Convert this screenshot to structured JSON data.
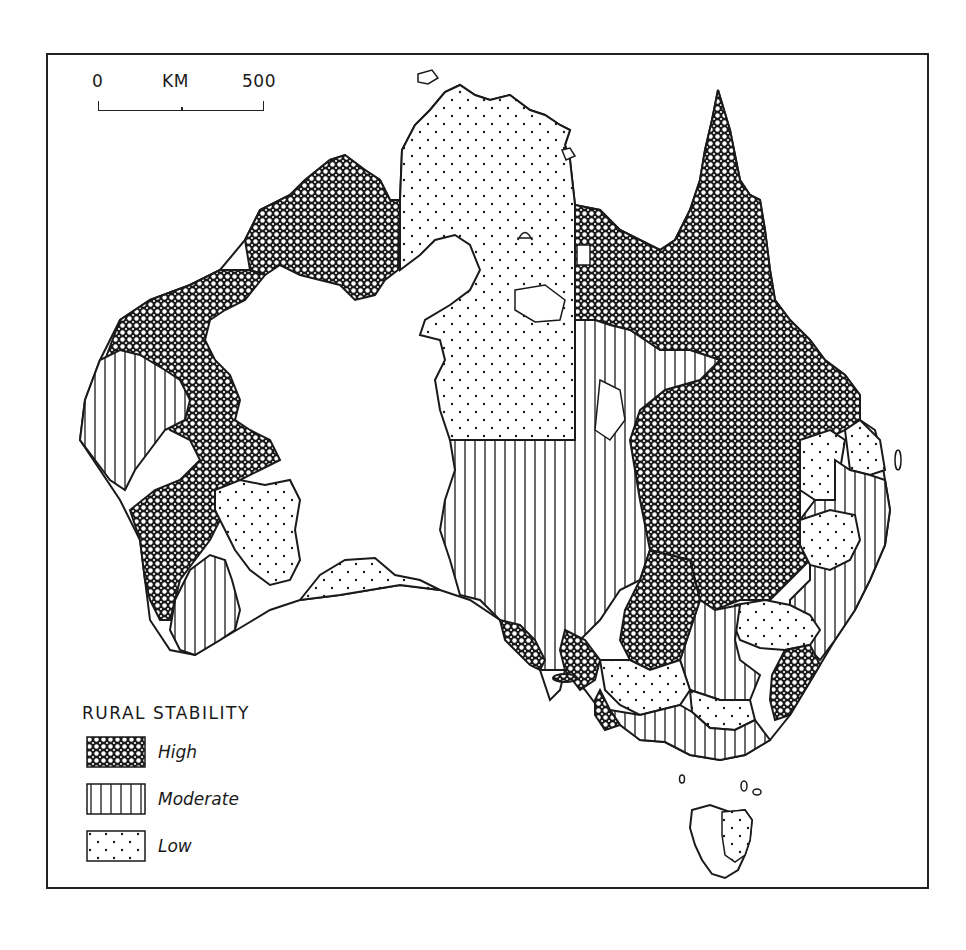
{
  "map": {
    "title": "Rural Stability — Australia",
    "scale_bar": {
      "start_label": "0",
      "unit_label": "KM",
      "end_label": "500"
    },
    "legend": {
      "title": "RURAL  STABILITY",
      "items": [
        {
          "key": "high",
          "label": "High",
          "pattern": "crosshatch"
        },
        {
          "key": "moderate",
          "label": "Moderate",
          "pattern": "vertical-lines"
        },
        {
          "key": "low",
          "label": "Low",
          "pattern": "dots"
        }
      ]
    },
    "colors": {
      "ink": "#1a1a1a",
      "paper": "#ffffff"
    },
    "regions": [
      {
        "name": "Kimberley / Top End west",
        "class": "high"
      },
      {
        "name": "Western Australia coast",
        "class": "high"
      },
      {
        "name": "South-west WA",
        "class": "moderate"
      },
      {
        "name": "Northern Territory",
        "class": "low"
      },
      {
        "name": "Queensland",
        "class": "high"
      },
      {
        "name": "South Australia interior",
        "class": "moderate"
      },
      {
        "name": "Western NSW",
        "class": "moderate"
      },
      {
        "name": "Eastern NSW / Victoria",
        "class": "low"
      },
      {
        "name": "Tasmania",
        "class": "low"
      }
    ]
  }
}
